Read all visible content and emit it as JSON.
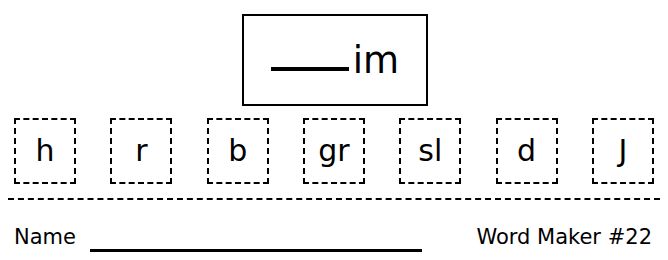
{
  "worksheet": {
    "ending": {
      "blank_line": "",
      "text": "im"
    },
    "tiles": [
      {
        "label": "h"
      },
      {
        "label": "r"
      },
      {
        "label": "b"
      },
      {
        "label": "gr"
      },
      {
        "label": "sl"
      },
      {
        "label": "d"
      },
      {
        "label": "J"
      }
    ],
    "footer": {
      "name_label": "Name",
      "name_line": "",
      "title": "Word Maker #22"
    }
  },
  "colors": {
    "ink": "#000000",
    "paper": "#ffffff"
  }
}
